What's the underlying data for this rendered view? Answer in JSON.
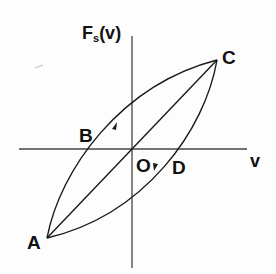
{
  "diagram": {
    "y_axis_label": {
      "main": "F",
      "sub": "s",
      "rest": "(v)"
    },
    "x_axis_label": "v",
    "points": {
      "A": "A",
      "B": "B",
      "C": "C",
      "D": "D",
      "O": "O"
    },
    "colors": {
      "line": "#1a1a1a",
      "background": "#fdfdfd"
    }
  }
}
